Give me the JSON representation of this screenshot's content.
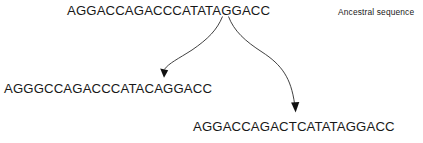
{
  "diagram": {
    "background_color": "#ffffff",
    "text_color": "#181818",
    "arrow_color": "#2b2b2b"
  },
  "sequences": {
    "ancestral": {
      "label": "AGGACCAGACCCATATAGGACC",
      "caption": "Ancestral sequence"
    },
    "descendant_left": {
      "label": "AGGGCCAGACCCATACAGGACC"
    },
    "descendant_right": {
      "label": "AGGACCAGACTCATATAGGACC"
    }
  },
  "arrows": [
    {
      "name": "arrow-to-left-descendant",
      "from": "ancestral",
      "to": "descendant_left"
    },
    {
      "name": "arrow-to-right-descendant",
      "from": "ancestral",
      "to": "descendant_right"
    }
  ]
}
